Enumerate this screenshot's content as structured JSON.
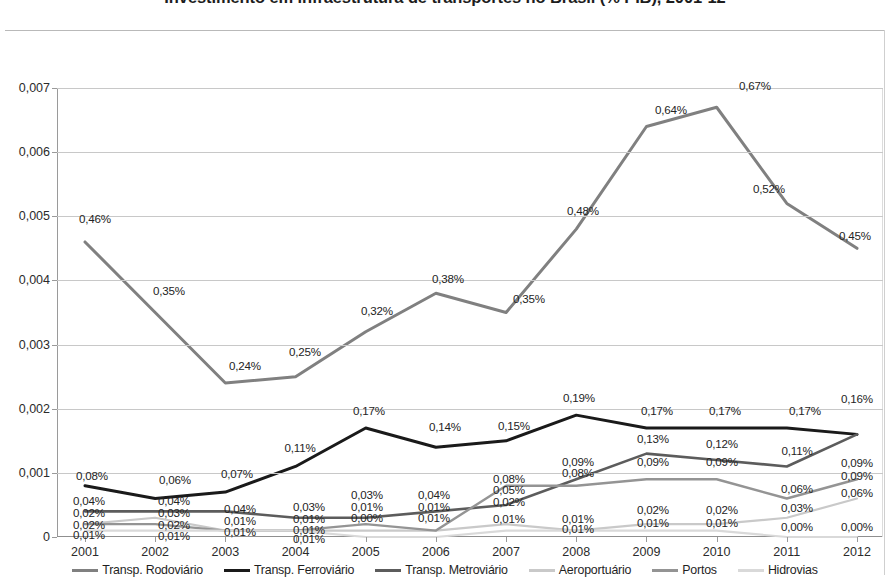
{
  "title": "Investimento em infraestrutura de transportes no Brasil (% PIB), 2001-12",
  "axis": {
    "y_ticks": [
      "0,007",
      "0,006",
      "0,005",
      "0,004",
      "0,003",
      "0,002",
      "0,001",
      "0"
    ],
    "x_ticks": [
      "2001",
      "2002",
      "2003",
      "2004",
      "2005",
      "2006",
      "2007",
      "2008",
      "2009",
      "2010",
      "2011",
      "2012"
    ]
  },
  "legend": {
    "items": [
      {
        "label": "Transp. Rodoviário",
        "color": "#808080"
      },
      {
        "label": "Transp. Ferroviário",
        "color": "#1a1a1a"
      },
      {
        "label": "Transp. Metroviário",
        "color": "#5c5c5c"
      },
      {
        "label": "Aeroportuário",
        "color": "#c9c9c9"
      },
      {
        "label": "Portos",
        "color": "#949494"
      },
      {
        "label": "Hidrovias",
        "color": "#d9d9d9"
      }
    ]
  },
  "chart_data": {
    "type": "line",
    "title": "Investimento em infraestrutura de transportes no Brasil (% PIB), 2001-12",
    "xlabel": "",
    "ylabel": "",
    "ylim": [
      0,
      0.007
    ],
    "yticks": [
      0,
      0.001,
      0.002,
      0.003,
      0.004,
      0.005,
      0.006,
      0.007
    ],
    "grid": true,
    "legend_position": "bottom",
    "value_format": "percent-comma",
    "categories": [
      "2001",
      "2002",
      "2003",
      "2004",
      "2005",
      "2006",
      "2007",
      "2008",
      "2009",
      "2010",
      "2011",
      "2012"
    ],
    "series": [
      {
        "name": "Transp. Rodoviário",
        "color": "#808080",
        "values": [
          0.0046,
          0.0035,
          0.0024,
          0.0025,
          0.0032,
          0.0038,
          0.0035,
          0.0048,
          0.0064,
          0.0067,
          0.0052,
          0.0045
        ],
        "labels": [
          "0,46%",
          "0,35%",
          "0,24%",
          "0,25%",
          "0,32%",
          "0,38%",
          "0,35%",
          "0,48%",
          "0,64%",
          "0,67%",
          "0,52%",
          "0,45%"
        ]
      },
      {
        "name": "Transp. Ferroviário",
        "color": "#1a1a1a",
        "values": [
          0.0008,
          0.0006,
          0.0007,
          0.0011,
          0.0017,
          0.0014,
          0.0015,
          0.0019,
          0.0017,
          0.0017,
          0.0017,
          0.0016
        ],
        "labels": [
          "0,08%",
          "0,06%",
          "0,07%",
          "0,11%",
          "0,17%",
          "0,14%",
          "0,15%",
          "0,19%",
          "0,17%",
          "0,17%",
          "0,17%",
          "0,16%"
        ]
      },
      {
        "name": "Transp. Metroviário",
        "color": "#5c5c5c",
        "values": [
          0.0004,
          0.0004,
          0.0004,
          0.0003,
          0.0003,
          0.0004,
          0.0005,
          0.0009,
          0.0013,
          0.0012,
          0.0011,
          0.0016
        ],
        "labels": [
          "0,04%",
          "0,04%",
          "0,04%",
          "0,03%",
          "0,03%",
          "0,04%",
          "0,05%",
          "0,09%",
          "0,13%",
          "0,12%",
          "0,11%",
          "0,16%"
        ]
      },
      {
        "name": "Aeroportuário",
        "color": "#c9c9c9",
        "values": [
          0.0002,
          0.0003,
          0.0001,
          0.0001,
          0.0001,
          0.0001,
          0.0002,
          0.0001,
          0.0002,
          0.0002,
          0.0003,
          0.0006
        ],
        "labels": [
          "0,02%",
          "0,03%",
          "0,01%",
          "0,01%",
          "0,01%",
          "0,01%",
          "0,02%",
          "0,01%",
          "0,02%",
          "0,02%",
          "0,03%",
          "0,06%"
        ]
      },
      {
        "name": "Portos",
        "color": "#949494",
        "values": [
          0.0002,
          0.0002,
          0.0001,
          0.0001,
          0.0002,
          0.0001,
          0.0008,
          0.0008,
          0.0009,
          0.0009,
          0.0006,
          0.0009
        ],
        "labels": [
          "0,02%",
          "0,02%",
          "0,01%",
          "0,01%",
          "0,02%",
          "0,01%",
          "0,08%",
          "0,08%",
          "0,09%",
          "0,09%",
          "0,06%",
          "0,09%"
        ]
      },
      {
        "name": "Hidrovias",
        "color": "#d9d9d9",
        "values": [
          0.0001,
          0.0001,
          0.0001,
          0.0001,
          0.0,
          0.0,
          0.0001,
          0.0001,
          0.0001,
          0.0001,
          0.0,
          0.0
        ],
        "labels": [
          "0,01%",
          "0,01%",
          "0,01%",
          "0,01%",
          "0,00%",
          "0,00%",
          "0,01%",
          "0,01%",
          "0,01%",
          "0,01%",
          "0,00%",
          "0,00%"
        ]
      }
    ],
    "data_labels": [
      {
        "text": "0,46%",
        "x": 2001,
        "value": 0.0046,
        "series": "Transp. Rodoviário",
        "px": 38,
        "py": 130
      },
      {
        "text": "0,35%",
        "x": 2002,
        "value": 0.0035,
        "series": "Transp. Rodoviário",
        "px": 112,
        "py": 202
      },
      {
        "text": "0,24%",
        "x": 2003,
        "value": 0.0024,
        "series": "Transp. Rodoviário",
        "px": 188,
        "py": 277
      },
      {
        "text": "0,25%",
        "x": 2004,
        "value": 0.0025,
        "series": "Transp. Rodoviário",
        "px": 248,
        "py": 263
      },
      {
        "text": "0,32%",
        "x": 2005,
        "value": 0.0032,
        "series": "Transp. Rodoviário",
        "px": 320,
        "py": 222
      },
      {
        "text": "0,38%",
        "x": 2006,
        "value": 0.0038,
        "series": "Transp. Rodoviário",
        "px": 391,
        "py": 190
      },
      {
        "text": "0,35%",
        "x": 2007,
        "value": 0.0035,
        "series": "Transp. Rodoviário",
        "px": 472,
        "py": 210
      },
      {
        "text": "0,48%",
        "x": 2008,
        "value": 0.0048,
        "series": "Transp. Rodoviário",
        "px": 526,
        "py": 122
      },
      {
        "text": "0,64%",
        "x": 2009,
        "value": 0.0064,
        "series": "Transp. Rodoviário",
        "px": 614,
        "py": 21
      },
      {
        "text": "0,67%",
        "x": 2010,
        "value": 0.0067,
        "series": "Transp. Rodoviário",
        "px": 698,
        "py": -3
      },
      {
        "text": "0,52%",
        "x": 2011,
        "value": 0.0052,
        "series": "Transp. Rodoviário",
        "px": 712,
        "py": 100
      },
      {
        "text": "0,45%",
        "x": 2012,
        "value": 0.0045,
        "series": "Transp. Rodoviário",
        "px": 798,
        "py": 147
      },
      {
        "text": "0,08%",
        "x": 2001,
        "value": 0.0008,
        "series": "Transp. Ferroviário",
        "px": 35,
        "py": 387
      },
      {
        "text": "0,06%",
        "x": 2002,
        "value": 0.0006,
        "series": "Transp. Ferroviário",
        "px": 118,
        "py": 391
      },
      {
        "text": "0,07%",
        "x": 2003,
        "value": 0.0007,
        "series": "Transp. Ferroviário",
        "px": 180,
        "py": 385
      },
      {
        "text": "0,11%",
        "x": 2004,
        "value": 0.0011,
        "series": "Transp. Ferroviário",
        "px": 243,
        "py": 359
      },
      {
        "text": "0,17%",
        "x": 2005,
        "value": 0.0017,
        "series": "Transp. Ferroviário",
        "px": 312,
        "py": 322
      },
      {
        "text": "0,14%",
        "x": 2006,
        "value": 0.0014,
        "series": "Transp. Ferroviário",
        "px": 388,
        "py": 338
      },
      {
        "text": "0,15%",
        "x": 2007,
        "value": 0.0015,
        "series": "Transp. Ferroviário",
        "px": 457,
        "py": 337
      },
      {
        "text": "0,19%",
        "x": 2008,
        "value": 0.0019,
        "series": "Transp. Ferroviário",
        "px": 522,
        "py": 309
      },
      {
        "text": "0,17%",
        "x": 2009,
        "value": 0.0017,
        "series": "Transp. Ferroviário",
        "px": 600,
        "py": 322
      },
      {
        "text": "0,17%",
        "x": 2010,
        "value": 0.0017,
        "series": "Transp. Ferroviário",
        "px": 668,
        "py": 322
      },
      {
        "text": "0,17%",
        "x": 2011,
        "value": 0.0017,
        "series": "Transp. Ferroviário",
        "px": 748,
        "py": 322
      },
      {
        "text": "0,16%",
        "x": 2012,
        "value": 0.0016,
        "series": "Transp. Ferroviário",
        "px": 800,
        "py": 310
      },
      {
        "text": "0,04%",
        "x": 2001,
        "value": 0.0004,
        "series": "Transp. Metroviário",
        "px": 32,
        "py": 412
      },
      {
        "text": "0,04%",
        "x": 2002,
        "value": 0.0004,
        "series": "Transp. Metroviário",
        "px": 117,
        "py": 412
      },
      {
        "text": "0,04%",
        "x": 2003,
        "value": 0.0004,
        "series": "Transp. Metroviário",
        "px": 183,
        "py": 420
      },
      {
        "text": "0,03%",
        "x": 2004,
        "value": 0.0003,
        "series": "Transp. Metroviário",
        "px": 252,
        "py": 418
      },
      {
        "text": "0,03%",
        "x": 2005,
        "value": 0.0003,
        "series": "Transp. Metroviário",
        "px": 310,
        "py": 406
      },
      {
        "text": "0,04%",
        "x": 2006,
        "value": 0.0004,
        "series": "Transp. Metroviário",
        "px": 377,
        "py": 406
      },
      {
        "text": "0,05%",
        "x": 2007,
        "value": 0.0005,
        "series": "Transp. Metroviário",
        "px": 452,
        "py": 401
      },
      {
        "text": "0,09%",
        "x": 2008,
        "value": 0.0009,
        "series": "Transp. Metroviário",
        "px": 521,
        "py": 373
      },
      {
        "text": "0,13%",
        "x": 2009,
        "value": 0.0013,
        "series": "Transp. Metroviário",
        "px": 596,
        "py": 350
      },
      {
        "text": "0,12%",
        "x": 2010,
        "value": 0.0012,
        "series": "Transp. Metroviário",
        "px": 665,
        "py": 355
      },
      {
        "text": "0,11%",
        "x": 2011,
        "value": 0.0011,
        "series": "Transp. Metroviário",
        "px": 740,
        "py": 362
      },
      {
        "text": "0,09%",
        "x": 2012,
        "value": 0.0009,
        "series": "Transp. Metroviário",
        "px": 800,
        "py": 374
      },
      {
        "text": "0,02%",
        "x": 2001,
        "value": 0.0002,
        "series": "Aeroportuário",
        "px": 32,
        "py": 424
      },
      {
        "text": "0,03%",
        "x": 2002,
        "value": 0.0003,
        "series": "Aeroportuário",
        "px": 117,
        "py": 424
      },
      {
        "text": "0,01%",
        "x": 2003,
        "value": 0.0001,
        "series": "Aeroportuário",
        "px": 183,
        "py": 432
      },
      {
        "text": "0,01%",
        "x": 2004,
        "value": 0.0001,
        "series": "Aeroportuário",
        "px": 252,
        "py": 430
      },
      {
        "text": "0,01%",
        "x": 2005,
        "value": 0.0001,
        "series": "Aeroportuário",
        "px": 310,
        "py": 418
      },
      {
        "text": "0,01%",
        "x": 2006,
        "value": 0.0001,
        "series": "Aeroportuário",
        "px": 377,
        "py": 418
      },
      {
        "text": "0,02%",
        "x": 2007,
        "value": 0.0002,
        "series": "Aeroportuário",
        "px": 452,
        "py": 413
      },
      {
        "text": "0,01%",
        "x": 2008,
        "value": 0.0001,
        "series": "Aeroportuário",
        "px": 521,
        "py": 430
      },
      {
        "text": "0,02%",
        "x": 2009,
        "value": 0.0002,
        "series": "Aeroportuário",
        "px": 596,
        "py": 421
      },
      {
        "text": "0,02%",
        "x": 2010,
        "value": 0.0002,
        "series": "Aeroportuário",
        "px": 665,
        "py": 421
      },
      {
        "text": "0,03%",
        "x": 2011,
        "value": 0.0003,
        "series": "Aeroportuário",
        "px": 740,
        "py": 419
      },
      {
        "text": "0,06%",
        "x": 2012,
        "value": 0.0006,
        "series": "Aeroportuário",
        "px": 800,
        "py": 404
      },
      {
        "text": "0,02%",
        "x": 2001,
        "value": 0.0002,
        "series": "Portos",
        "px": 32,
        "py": 436
      },
      {
        "text": "0,02%",
        "x": 2002,
        "value": 0.0002,
        "series": "Portos",
        "px": 117,
        "py": 436
      },
      {
        "text": "0,01%",
        "x": 2003,
        "value": 0.0001,
        "series": "Portos",
        "px": 183,
        "py": 443
      },
      {
        "text": "0,01%",
        "x": 2004,
        "value": 0.0001,
        "series": "Portos",
        "px": 252,
        "py": 441
      },
      {
        "text": "0,00%",
        "x": 2005,
        "value": 0.0,
        "series": "Portos",
        "px": 310,
        "py": 429
      },
      {
        "text": "0,01%",
        "x": 2006,
        "value": 0.0001,
        "series": "Portos",
        "px": 377,
        "py": 429
      },
      {
        "text": "0,08%",
        "x": 2007,
        "value": 0.0008,
        "series": "Portos",
        "px": 452,
        "py": 390
      },
      {
        "text": "0,08%",
        "x": 2008,
        "value": 0.0008,
        "series": "Portos",
        "px": 521,
        "py": 384
      },
      {
        "text": "0,09%",
        "x": 2009,
        "value": 0.0009,
        "series": "Portos",
        "px": 596,
        "py": 373
      },
      {
        "text": "0,09%",
        "x": 2010,
        "value": 0.0009,
        "series": "Portos",
        "px": 665,
        "py": 373
      },
      {
        "text": "0,06%",
        "x": 2011,
        "value": 0.0006,
        "series": "Portos",
        "px": 740,
        "py": 400
      },
      {
        "text": "0,09%",
        "x": 2012,
        "value": 0.0009,
        "series": "Portos",
        "px": 800,
        "py": 387
      },
      {
        "text": "0,01%",
        "x": 2001,
        "value": 0.0001,
        "series": "Hidrovias",
        "px": 32,
        "py": 446
      },
      {
        "text": "0,01%",
        "x": 2002,
        "value": 0.0001,
        "series": "Hidrovias",
        "px": 117,
        "py": 447
      },
      {
        "text": "0,01%",
        "x": 2004,
        "value": 0.0001,
        "series": "Hidrovias",
        "px": 252,
        "py": 450
      },
      {
        "text": "0,01%",
        "x": 2007,
        "value": 0.0001,
        "series": "Hidrovias",
        "px": 452,
        "py": 430
      },
      {
        "text": "0,01%",
        "x": 2008,
        "value": 0.0001,
        "series": "Hidrovias",
        "px": 521,
        "py": 440
      },
      {
        "text": "0,01%",
        "x": 2009,
        "value": 0.0001,
        "series": "Hidrovias",
        "px": 596,
        "py": 434
      },
      {
        "text": "0,01%",
        "x": 2010,
        "value": 0.0001,
        "series": "Hidrovias",
        "px": 665,
        "py": 434
      },
      {
        "text": "0,00%",
        "x": 2011,
        "value": 0.0,
        "series": "Hidrovias",
        "px": 740,
        "py": 438
      },
      {
        "text": "0,00%",
        "x": 2012,
        "value": 0.0,
        "series": "Hidrovias",
        "px": 800,
        "py": 438
      }
    ]
  }
}
